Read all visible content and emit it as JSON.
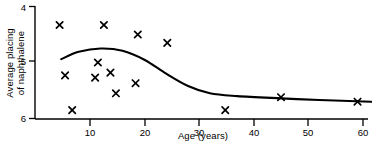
{
  "chart_data": {
    "type": "scatter",
    "title": "",
    "subtitle": "",
    "xlabel": "Age (years)",
    "ylabel": "Average placing of naphthalene",
    "ylabel_lines": [
      "Average placing",
      "of naphthalene"
    ],
    "xlim": [
      0,
      60
    ],
    "ylim": [
      4,
      6
    ],
    "y_inverted": true,
    "grid": false,
    "legend": null,
    "xticks": [
      10,
      20,
      30,
      40,
      50,
      60
    ],
    "xtick_labels": [
      "10",
      "20",
      "30",
      "40",
      "50",
      "60"
    ],
    "yticks": [
      4,
      5,
      6
    ],
    "ytick_labels": [
      "4",
      "5",
      "6"
    ],
    "marker": "x",
    "marker_color": "#000000",
    "line_color": "#000000",
    "axis_color": "#000000",
    "series": [
      {
        "name": "Average placing of naphthalene",
        "type": "scatter",
        "points": [
          {
            "x": 4.5,
            "y": 4.33
          },
          {
            "x": 12.6,
            "y": 4.33
          },
          {
            "x": 18.8,
            "y": 4.5
          },
          {
            "x": 24.2,
            "y": 4.65
          },
          {
            "x": 11.5,
            "y": 5.0
          },
          {
            "x": 13.8,
            "y": 5.18
          },
          {
            "x": 5.5,
            "y": 5.23
          },
          {
            "x": 11.0,
            "y": 5.27
          },
          {
            "x": 18.4,
            "y": 5.37
          },
          {
            "x": 14.8,
            "y": 5.55
          },
          {
            "x": 6.8,
            "y": 5.85
          },
          {
            "x": 34.8,
            "y": 5.85
          },
          {
            "x": 45.0,
            "y": 5.62
          },
          {
            "x": 59.0,
            "y": 5.7
          }
        ]
      },
      {
        "name": "fitted trend curve",
        "type": "line",
        "points": [
          {
            "x": 4.8,
            "y": 4.94
          },
          {
            "x": 8.0,
            "y": 4.81
          },
          {
            "x": 12.0,
            "y": 4.75
          },
          {
            "x": 16.0,
            "y": 4.79
          },
          {
            "x": 20.0,
            "y": 4.95
          },
          {
            "x": 24.0,
            "y": 5.2
          },
          {
            "x": 28.0,
            "y": 5.42
          },
          {
            "x": 32.0,
            "y": 5.55
          },
          {
            "x": 37.0,
            "y": 5.6
          },
          {
            "x": 45.0,
            "y": 5.64
          },
          {
            "x": 52.0,
            "y": 5.67
          },
          {
            "x": 61.5,
            "y": 5.7
          }
        ]
      }
    ]
  },
  "axes": {
    "x_axis_label": "Age (years)",
    "y_axis_label_line1": "Average placing",
    "y_axis_label_line2": "of naphthalene",
    "xtick_10": "10",
    "xtick_20": "20",
    "xtick_30": "30",
    "xtick_40": "40",
    "xtick_50": "50",
    "xtick_60": "60",
    "ytick_4": "4",
    "ytick_5": "5",
    "ytick_6": "6"
  }
}
